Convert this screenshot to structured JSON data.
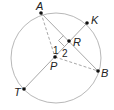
{
  "diagram": {
    "type": "circle-geometry",
    "colors": {
      "circle": "#b8b8b8",
      "line": "#a8a8a8",
      "point": "#111111",
      "text": "#222222",
      "background": "#ffffff"
    },
    "circle": {
      "center": "P",
      "cx": 56,
      "cy": 58,
      "r": 45
    },
    "points": {
      "A": {
        "label": "A",
        "x": 41,
        "y": 13
      },
      "K": {
        "label": "K",
        "x": 87,
        "y": 23
      },
      "R": {
        "label": "R",
        "x": 69,
        "y": 41
      },
      "P": {
        "label": "P",
        "x": 55,
        "y": 57
      },
      "B": {
        "label": "B",
        "x": 98,
        "y": 71
      },
      "T": {
        "label": "T",
        "x": 24,
        "y": 89
      }
    },
    "segments": [
      {
        "from": "A",
        "to": "B",
        "style": "solid"
      },
      {
        "from": "T",
        "to": "K",
        "style": "solid"
      },
      {
        "from": "A",
        "to": "P",
        "style": "dashed"
      },
      {
        "from": "P",
        "to": "B",
        "style": "dashed"
      }
    ],
    "angle_labels": {
      "angle1": "1",
      "angle2": "2"
    },
    "right_angle_at": "R"
  }
}
